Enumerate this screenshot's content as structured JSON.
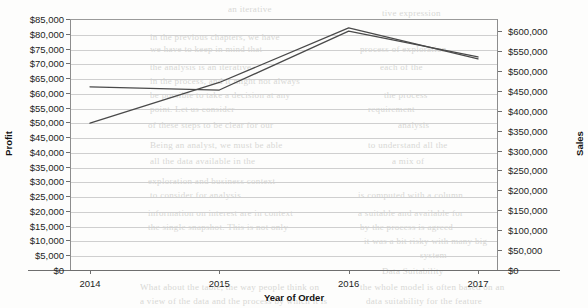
{
  "chart_data": {
    "type": "line",
    "title": "",
    "xlabel": "Year of Order",
    "ylabel": "Profit",
    "y2label": "Sales",
    "categories": [
      "2014",
      "2015",
      "2016",
      "2017"
    ],
    "x": [
      2014,
      2015,
      2016,
      2017
    ],
    "grid": true,
    "legend": "none",
    "series": [
      {
        "name": "Profit",
        "axis": "left",
        "color": "#4a4a4a",
        "values": [
          49700,
          63500,
          82000,
          71500
        ]
      },
      {
        "name": "Sales",
        "axis": "right",
        "color": "#4a4a4a",
        "values": [
          460000,
          452000,
          600000,
          535000
        ]
      }
    ],
    "left_axis": {
      "label": "Profit",
      "min": 0,
      "max": 85000,
      "step": 5000,
      "ticks": [
        "$85,000",
        "$80,000",
        "$75,000",
        "$70,000",
        "$65,000",
        "$60,000",
        "$55,000",
        "$50,000",
        "$45,000",
        "$40,000",
        "$35,000",
        "$30,000",
        "$25,000",
        "$20,000",
        "$15,000",
        "$10,000",
        "$5,000",
        "$0"
      ],
      "tick_values": [
        85000,
        80000,
        75000,
        70000,
        65000,
        60000,
        55000,
        50000,
        45000,
        40000,
        35000,
        30000,
        25000,
        20000,
        15000,
        10000,
        5000,
        0
      ]
    },
    "right_axis": {
      "label": "Sales",
      "min": 0,
      "max": 600000,
      "step": 50000,
      "ticks": [
        "$600,000",
        "$550,000",
        "$500,000",
        "$450,000",
        "$400,000",
        "$350,000",
        "$300,000",
        "$250,000",
        "$200,000",
        "$150,000",
        "$100,000",
        "$50,000",
        "$0"
      ],
      "tick_values": [
        600000,
        550000,
        500000,
        450000,
        400000,
        350000,
        300000,
        250000,
        200000,
        150000,
        100000,
        50000,
        0
      ]
    },
    "x_axis": {
      "label": "Year of Order",
      "ticks": [
        "2014",
        "2015",
        "2016",
        "2017"
      ]
    }
  },
  "background_bleed": [
    {
      "text": "an iterative",
      "x": 228,
      "y": 4
    },
    {
      "text": "tive expression",
      "x": 382,
      "y": 8
    },
    {
      "text": "in the previous chapters, we have",
      "x": 150,
      "y": 32
    },
    {
      "text": "we have to keep in mind that",
      "x": 150,
      "y": 44
    },
    {
      "text": "process of exploration",
      "x": 360,
      "y": 44
    },
    {
      "text": "the analysis is an iterative",
      "x": 150,
      "y": 62
    },
    {
      "text": "each of the",
      "x": 380,
      "y": 62
    },
    {
      "text": "in the process, and it might not always",
      "x": 150,
      "y": 76
    },
    {
      "text": "be possible to take a decision at any",
      "x": 150,
      "y": 90
    },
    {
      "text": "the process",
      "x": 384,
      "y": 90
    },
    {
      "text": "point. Let us consider",
      "x": 150,
      "y": 104
    },
    {
      "text": "requirement",
      "x": 368,
      "y": 104
    },
    {
      "text": "of these steps to be clear for our",
      "x": 148,
      "y": 120
    },
    {
      "text": "analysis",
      "x": 398,
      "y": 120
    },
    {
      "text": "Being an analyst, we must be able",
      "x": 150,
      "y": 140
    },
    {
      "text": "to understand all the",
      "x": 368,
      "y": 140
    },
    {
      "text": "all the data available in the",
      "x": 150,
      "y": 156
    },
    {
      "text": "a mix of",
      "x": 392,
      "y": 156
    },
    {
      "text": "exploration and business context",
      "x": 148,
      "y": 176
    },
    {
      "text": "to consider for analysis",
      "x": 150,
      "y": 190
    },
    {
      "text": "is computed with a column",
      "x": 358,
      "y": 190
    },
    {
      "text": "information on interest are in context",
      "x": 148,
      "y": 208
    },
    {
      "text": "a suitable and available for",
      "x": 358,
      "y": 208
    },
    {
      "text": "the single snapshot. This is not only",
      "x": 148,
      "y": 222
    },
    {
      "text": "by the process is agreed",
      "x": 360,
      "y": 222
    },
    {
      "text": "it was a bit risky with many big",
      "x": 364,
      "y": 236
    },
    {
      "text": "system",
      "x": 420,
      "y": 250
    },
    {
      "text": "Data Suitability",
      "x": 382,
      "y": 266
    },
    {
      "text": "What about the table, the way people think on",
      "x": 140,
      "y": 282
    },
    {
      "text": "the whole model is often based on an",
      "x": 360,
      "y": 282
    },
    {
      "text": "a view of the data and the process by which it is",
      "x": 140,
      "y": 296
    },
    {
      "text": "data suitability for the feature",
      "x": 366,
      "y": 296
    }
  ]
}
